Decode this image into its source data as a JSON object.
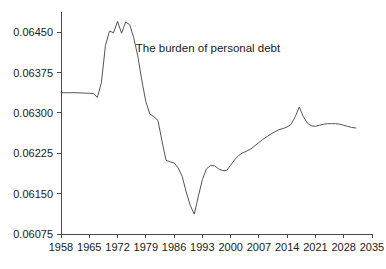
{
  "chart_data": {
    "type": "line",
    "title": "",
    "annotations": [
      {
        "text": "The burden of personal debt",
        "x": 1976.5,
        "y": 0.064125
      }
    ],
    "xlabel": "",
    "ylabel": "",
    "xlim": [
      1958,
      2035
    ],
    "ylim": [
      0.06075,
      0.064875
    ],
    "grid": false,
    "legend": null,
    "xticks": [
      1958,
      1965,
      1972,
      1979,
      1986,
      1993,
      2000,
      2007,
      2014,
      2021,
      2028,
      2035
    ],
    "xtick_labels": [
      "1958",
      "1965",
      "1972",
      "1979",
      "1986",
      "1993",
      "2000",
      "2007",
      "2014",
      "2021",
      "2028",
      "2035"
    ],
    "yticks": [
      0.06075,
      0.0615,
      0.06225,
      0.063,
      0.06375,
      0.0645
    ],
    "ytick_labels": [
      "0.06075",
      "0.06150",
      "0.06225",
      "0.06300",
      "0.06375",
      "0.06450"
    ],
    "series": [
      {
        "name": "burden-of-personal-debt",
        "color": "#555555",
        "x": [
          1958,
          1959,
          1960,
          1961,
          1962,
          1963,
          1964,
          1965,
          1966,
          1967,
          1968,
          1969,
          1970,
          1971,
          1972,
          1973,
          1974,
          1975,
          1976,
          1977,
          1978,
          1979,
          1980,
          1981,
          1982,
          1983,
          1984,
          1985,
          1986,
          1987,
          1988,
          1989,
          1990,
          1991,
          1992,
          1993,
          1994,
          1995,
          1996,
          1997,
          1998,
          1999,
          2000,
          2001,
          2002,
          2003,
          2004,
          2005,
          2006,
          2007,
          2008,
          2009,
          2010,
          2011,
          2012,
          2013,
          2014,
          2015,
          2016,
          2017,
          2018,
          2019,
          2020,
          2021,
          2022,
          2023,
          2024,
          2025,
          2026,
          2027,
          2028,
          2029,
          2030,
          2031
        ],
        "y": [
          0.063375,
          0.063375,
          0.063375,
          0.063375,
          0.063375,
          0.06337,
          0.063368,
          0.063365,
          0.06336,
          0.06329,
          0.06356,
          0.06425,
          0.06452,
          0.06449,
          0.0647,
          0.06448,
          0.06469,
          0.06464,
          0.0644,
          0.06406,
          0.06361,
          0.06321,
          0.06298,
          0.06293,
          0.06286,
          0.06248,
          0.06212,
          0.06209,
          0.06207,
          0.06198,
          0.06182,
          0.06153,
          0.06128,
          0.06112,
          0.06145,
          0.06176,
          0.06196,
          0.06202,
          0.06202,
          0.06196,
          0.06193,
          0.06193,
          0.06203,
          0.06213,
          0.06221,
          0.06226,
          0.06229,
          0.06233,
          0.06239,
          0.06245,
          0.06251,
          0.06256,
          0.06261,
          0.06265,
          0.06269,
          0.06271,
          0.06274,
          0.06279,
          0.06293,
          0.06311,
          0.06293,
          0.06281,
          0.06276,
          0.06275,
          0.06277,
          0.06279,
          0.0628,
          0.0628,
          0.0628,
          0.06279,
          0.06277,
          0.06275,
          0.06273,
          0.06272
        ]
      }
    ]
  },
  "layout": {
    "plot_left": 61,
    "plot_right": 372,
    "plot_top": 12,
    "plot_bottom": 234
  }
}
